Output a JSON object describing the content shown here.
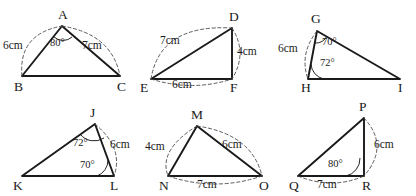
{
  "sheet": {
    "title": "Triangle construction figures",
    "background_color": "#ffffff",
    "line_color": "#1a1a1a",
    "arc_color": "#4a4a4a"
  },
  "figures": [
    {
      "id": "figure-abc",
      "vertices": [
        {
          "name": "A",
          "label": "A"
        },
        {
          "name": "B",
          "label": "B"
        },
        {
          "name": "C",
          "label": "C"
        }
      ],
      "lengths": [
        {
          "side": "AB",
          "label": "6cm"
        },
        {
          "side": "AC",
          "label": "7cm"
        }
      ],
      "angles": [
        {
          "at": "A",
          "label": "80°"
        }
      ]
    },
    {
      "id": "figure-def",
      "vertices": [
        {
          "name": "D",
          "label": "D"
        },
        {
          "name": "E",
          "label": "E"
        },
        {
          "name": "F",
          "label": "F"
        }
      ],
      "lengths": [
        {
          "side": "DE",
          "label": "7cm"
        },
        {
          "side": "DF",
          "label": "4cm"
        },
        {
          "side": "EF",
          "label": "6cm"
        }
      ],
      "angles": []
    },
    {
      "id": "figure-ghi",
      "vertices": [
        {
          "name": "G",
          "label": "G"
        },
        {
          "name": "H",
          "label": "H"
        },
        {
          "name": "I",
          "label": "I"
        }
      ],
      "lengths": [
        {
          "side": "GH",
          "label": "6cm"
        }
      ],
      "angles": [
        {
          "at": "G",
          "label": "70°"
        },
        {
          "at": "H",
          "label": "72°"
        }
      ]
    },
    {
      "id": "figure-jkl",
      "vertices": [
        {
          "name": "J",
          "label": "J"
        },
        {
          "name": "K",
          "label": "K"
        },
        {
          "name": "L",
          "label": "L"
        }
      ],
      "lengths": [
        {
          "side": "JL",
          "label": "6cm"
        }
      ],
      "angles": [
        {
          "at": "J",
          "label": "72°"
        },
        {
          "at": "L",
          "label": "70°"
        }
      ]
    },
    {
      "id": "figure-mno",
      "vertices": [
        {
          "name": "M",
          "label": "M"
        },
        {
          "name": "N",
          "label": "N"
        },
        {
          "name": "O",
          "label": "O"
        }
      ],
      "lengths": [
        {
          "side": "MN",
          "label": "4cm"
        },
        {
          "side": "MO",
          "label": "6cm"
        },
        {
          "side": "NO",
          "label": "7cm"
        }
      ],
      "angles": []
    },
    {
      "id": "figure-pqr",
      "vertices": [
        {
          "name": "P",
          "label": "P"
        },
        {
          "name": "Q",
          "label": "Q"
        },
        {
          "name": "R",
          "label": "R"
        }
      ],
      "lengths": [
        {
          "side": "PR",
          "label": "6cm"
        },
        {
          "side": "QR",
          "label": "7cm"
        }
      ],
      "angles": [
        {
          "at": "R",
          "label": "80°"
        }
      ]
    }
  ]
}
